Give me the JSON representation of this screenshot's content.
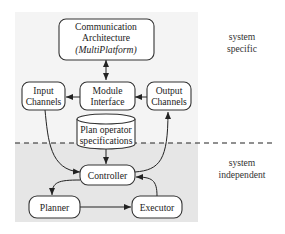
{
  "nodes": {
    "communication": {
      "line1": "Communication",
      "line2": "Architecture",
      "line3": "(MultiPlatform)"
    },
    "input_channels": {
      "line1": "Input",
      "line2": "Channels"
    },
    "module_interface": {
      "line1": "Module",
      "line2": "Interface"
    },
    "output_channels": {
      "line1": "Output",
      "line2": "Channels"
    },
    "plan_operator": {
      "line1": "Plan operator",
      "line2": "specifications"
    },
    "controller": {
      "label": "Controller"
    },
    "planner": {
      "label": "Planner"
    },
    "executor": {
      "label": "Executor"
    }
  },
  "regions": {
    "top": {
      "line1": "system",
      "line2": "specific"
    },
    "bottom": {
      "line1": "system",
      "line2": "independent"
    }
  },
  "edges": [
    {
      "from": "communication",
      "to": "module_interface",
      "type": "bidirectional"
    },
    {
      "from": "module_interface",
      "to": "input_channels"
    },
    {
      "from": "output_channels",
      "to": "module_interface"
    },
    {
      "from": "input_channels",
      "to": "controller"
    },
    {
      "from": "controller",
      "to": "output_channels"
    },
    {
      "from": "plan_operator",
      "to": "controller"
    },
    {
      "from": "controller",
      "to": "planner"
    },
    {
      "from": "planner",
      "to": "executor"
    },
    {
      "from": "executor",
      "to": "controller"
    }
  ]
}
